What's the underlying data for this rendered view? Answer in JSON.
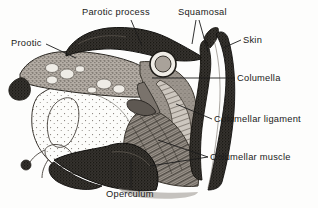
{
  "figure": {
    "kind": "anatomical-line-drawing",
    "background_color": "#fdfdfc",
    "ink_color": "#1b1b1b"
  },
  "labels": {
    "parotic_process": "Parotic process",
    "squamosal": "Squamosal",
    "prootic": "Prootic",
    "skin": "Skin",
    "columella": "Columella",
    "columellar_ligament": "Columellar ligament",
    "columellar_muscle": "Columellar muscle",
    "operculum": "Operculum"
  },
  "structures": [
    {
      "name": "parotic-process",
      "fill": "#2e2c2a",
      "note": "dark dorsal bony crest across the top of the section"
    },
    {
      "name": "prootic",
      "fill": "#8d8780",
      "note": "stippled bone with light marrow cavities, upper left"
    },
    {
      "name": "squamosal",
      "fill": "#3a3632",
      "note": "slender dark bone descending on the right of the otic capsule"
    },
    {
      "name": "skin",
      "fill": "#33302d",
      "note": "dark outer band along the right margin"
    },
    {
      "name": "columella",
      "fill": "#6e6762",
      "note": "small rod with rounded head in the centre of the section"
    },
    {
      "name": "columella-head",
      "fill": "#a9a29a",
      "note": "ring-shaped articular head, centre of the drawing"
    },
    {
      "name": "columellar-ligament",
      "fill": "#9a948d",
      "note": "pale band running from columella down and back"
    },
    {
      "name": "columellar-muscle",
      "fill": "#7d766f",
      "note": "striated muscle with diagonal fibres, lower right"
    },
    {
      "name": "operculum",
      "fill": "#262422",
      "note": "dark curved plate along the ventral border"
    },
    {
      "name": "otic-cartilage",
      "fill": "#fbfbf9",
      "note": "large pale stippled cartilage mass, lower left"
    }
  ],
  "leaders": [
    {
      "name": "leader-parotic-process",
      "from": "Parotic process",
      "to": "parotic-process"
    },
    {
      "name": "leader-squamosal-anterior",
      "from": "Squamosal",
      "to": "squamosal"
    },
    {
      "name": "leader-squamosal-posterior",
      "from": "Squamosal",
      "to": "squamosal"
    },
    {
      "name": "leader-prootic",
      "from": "Prootic",
      "to": "prootic"
    },
    {
      "name": "leader-skin",
      "from": "Skin",
      "to": "skin"
    },
    {
      "name": "leader-columella",
      "from": "Columella",
      "to": "columella"
    },
    {
      "name": "leader-columellar-ligament",
      "from": "Columellar ligament",
      "to": "columellar-ligament"
    },
    {
      "name": "leader-columellar-muscle-upper",
      "from": "Columellar muscle",
      "to": "columellar-muscle"
    },
    {
      "name": "leader-columellar-muscle-lower",
      "from": "Columellar muscle",
      "to": "columellar-muscle"
    },
    {
      "name": "leader-operculum",
      "from": "Operculum",
      "to": "operculum"
    }
  ]
}
